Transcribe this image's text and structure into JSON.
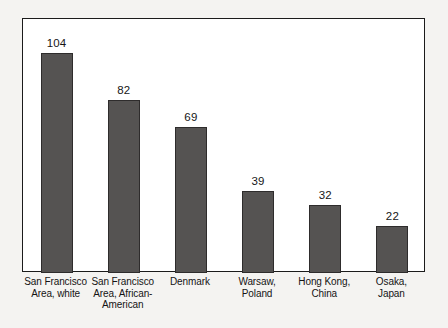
{
  "chart_data": {
    "type": "bar",
    "title": "",
    "subtitle": "",
    "xlabel": "",
    "ylabel": "",
    "ylim": [
      0,
      120
    ],
    "grid": false,
    "legend": false,
    "legend_position": "none",
    "axis_ticks": "none",
    "bar_color": "#555352",
    "bar_outline_color": "#2e2c2c",
    "frame_color": "#1b1b1b",
    "background_color": "#ffffff",
    "page_color": "#f4f3f1",
    "categories": [
      "San Francisco Area, white",
      "San Francisco Area, African-American",
      "Denmark",
      "Warsaw, Poland",
      "Hong Kong, China",
      "Osaka, Japan"
    ],
    "category_lines": [
      [
        "San Francisco",
        "Area, white"
      ],
      [
        "San Francisco",
        "Area, African-",
        "American"
      ],
      [
        "Denmark"
      ],
      [
        "Warsaw,",
        "Poland"
      ],
      [
        "Hong Kong,",
        "China"
      ],
      [
        "Osaka,",
        "Japan"
      ]
    ],
    "values": [
      104,
      82,
      69,
      39,
      32,
      22
    ],
    "value_labels": [
      "104",
      "82",
      "69",
      "39",
      "32",
      "22"
    ]
  }
}
